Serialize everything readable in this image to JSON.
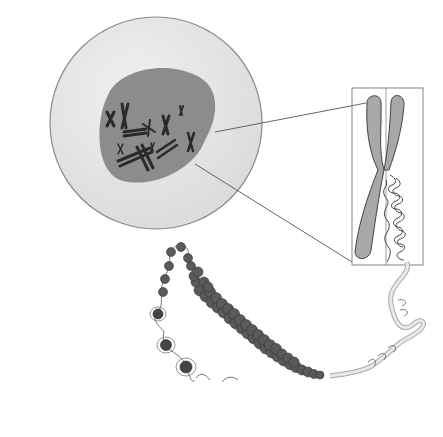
{
  "diagram": {
    "type": "biology-illustration",
    "labels": [],
    "components": [
      {
        "id": "cell",
        "description": "round cell with light gray cytoplasm"
      },
      {
        "id": "nucleus",
        "description": "dark gray nucleus containing condensed X-shaped chromosomes"
      },
      {
        "id": "chromosome-callout",
        "description": "enlarged X-shaped chromosome in rectangular inset, right chromatid shown as coiled chromatin"
      },
      {
        "id": "chromatin-fiber",
        "description": "coiled solenoid fiber of nucleosomes"
      },
      {
        "id": "nucleosomes",
        "description": "beads-on-a-string nucleosomes"
      },
      {
        "id": "dna-helix",
        "description": "double helix DNA strand unwinding from chromatin"
      }
    ],
    "colors": {
      "background": "#ffffff",
      "cytoplasm": "#e4e4e4",
      "cell_outline": "#8a8a8a",
      "nucleus": "#8c8c8c",
      "chromosome_dark": "#2a2a2a",
      "chromosome_large": "#a8a8a8",
      "nucleosome": "#5a5a5a",
      "dna": "#c8c8c8",
      "line": "#555555"
    }
  }
}
